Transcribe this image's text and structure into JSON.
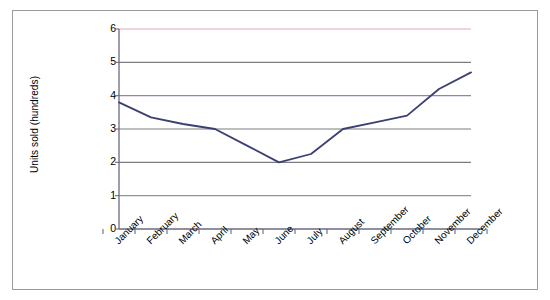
{
  "chart_data": {
    "type": "line",
    "title": "",
    "xlabel": "",
    "ylabel": "Units sold (hundreds)",
    "ylim": [
      0,
      6
    ],
    "y_ticks": [
      "0",
      "1",
      "2",
      "3",
      "4",
      "5",
      "6"
    ],
    "grid": true,
    "legend": "none",
    "categories": [
      "January",
      "February",
      "March",
      "April",
      "May",
      "June",
      "July",
      "August",
      "September",
      "October",
      "November",
      "December"
    ],
    "series": [
      {
        "name": "Units sold",
        "color": "#3b3f73",
        "values": [
          3.8,
          3.35,
          3.15,
          3.0,
          2.5,
          2.0,
          2.25,
          3.0,
          3.2,
          3.4,
          4.2,
          4.7
        ]
      }
    ],
    "gridline_colors": {
      "6": "#e8a6bd",
      "5": "#7d7d7d",
      "4": "#9b7fb0",
      "3": "#7d7d7d",
      "2": "#7d7d7d",
      "1": "#83a08a",
      "0": "#7d7d7d"
    },
    "axis_color": "#6a6a80",
    "frame_color": "#9a9a9a"
  }
}
